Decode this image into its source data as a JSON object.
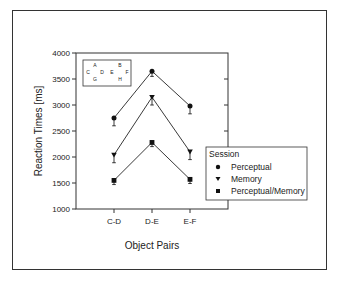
{
  "chart_data": {
    "type": "line",
    "title": "",
    "xlabel": "Object Pairs",
    "ylabel": "Reaction Times [ms]",
    "categories": [
      "C-D",
      "D-E",
      "E-F"
    ],
    "ylim": [
      1000,
      4000
    ],
    "yticks": [
      1000,
      1500,
      2000,
      2500,
      3000,
      3500,
      4000
    ],
    "grid": false,
    "legend": {
      "title": "Session",
      "position": "right-overlapping"
    },
    "series": [
      {
        "name": "Perceptual",
        "marker": "circle",
        "values": [
          2750,
          3650,
          2980
        ],
        "errors": [
          150,
          100,
          150
        ]
      },
      {
        "name": "Memory",
        "marker": "triangle-down",
        "values": [
          2040,
          3150,
          2100
        ],
        "errors": [
          150,
          150,
          150
        ]
      },
      {
        "name": "Perceptual/Memory",
        "marker": "square",
        "values": [
          1550,
          2280,
          1570
        ],
        "errors": [
          80,
          80,
          80
        ]
      }
    ],
    "inset": {
      "letters": [
        "A",
        "B",
        "C",
        "D",
        "E",
        "F",
        "G",
        "H"
      ]
    }
  },
  "labels": {
    "xlabel": "Object Pairs",
    "ylabel": "Reaction Times [ms]",
    "legend_title": "Session",
    "legend_items": [
      "Perceptual",
      "Memory",
      "Perceptual/Memory"
    ],
    "yticks": [
      "1000",
      "1500",
      "2000",
      "2500",
      "3000",
      "3500",
      "4000"
    ],
    "xticks": [
      "C-D",
      "D-E",
      "E-F"
    ],
    "inset": {
      "A": "A",
      "B": "B",
      "C": "C",
      "D": "D",
      "E": "E",
      "F": "F",
      "G": "G",
      "H": "H"
    }
  }
}
